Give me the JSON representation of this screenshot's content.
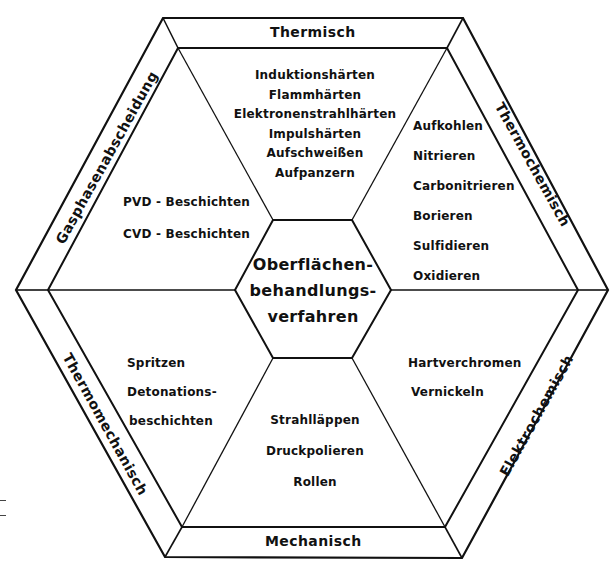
{
  "center": {
    "line1": "Oberflächen-",
    "line2": "behandlungs-",
    "line3": "verfahren"
  },
  "categories": {
    "top": "Thermisch",
    "upper_right": "Thermochemisch",
    "lower_right": "Elektrochemisch",
    "bottom": "Mechanisch",
    "lower_left": "Thermomechanisch",
    "upper_left": "Gasphasenabscheidung"
  },
  "sectors": {
    "thermisch": [
      "Induktionshärten",
      "Flammhärten",
      "Elektronenstrahlhärten",
      "Impulshärten",
      "Aufschweißen",
      "Aufpanzern"
    ],
    "thermochemisch": [
      "Aufkohlen",
      "Nitrieren",
      "Carbonitrieren",
      "Borieren",
      "Sulfidieren",
      "Oxidieren"
    ],
    "elektrochemisch": [
      "Hartverchromen",
      "Vernickeln"
    ],
    "mechanisch": [
      "Strahlläppen",
      "Druckpolieren",
      "Rollen"
    ],
    "thermomechanisch": [
      "Spritzen",
      "Detonations-",
      "beschichten"
    ],
    "gasphasenabscheidung": [
      "PVD - Beschichten",
      "CVD - Beschichten"
    ]
  },
  "colors": {
    "line": "#111111",
    "background": "#ffffff"
  }
}
